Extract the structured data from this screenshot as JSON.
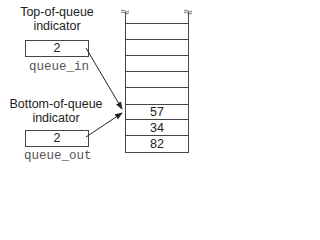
{
  "top_indicator": {
    "label_line1": "Top-of-queue",
    "label_line2": "indicator",
    "value": "2",
    "variable": "queue_in"
  },
  "bottom_indicator": {
    "label_line1": "Bottom-of-queue",
    "label_line2": "indicator",
    "value": "2",
    "variable": "queue_out"
  },
  "stack": {
    "empty_rows": 6,
    "cells": [
      "57",
      "34",
      "82"
    ]
  }
}
